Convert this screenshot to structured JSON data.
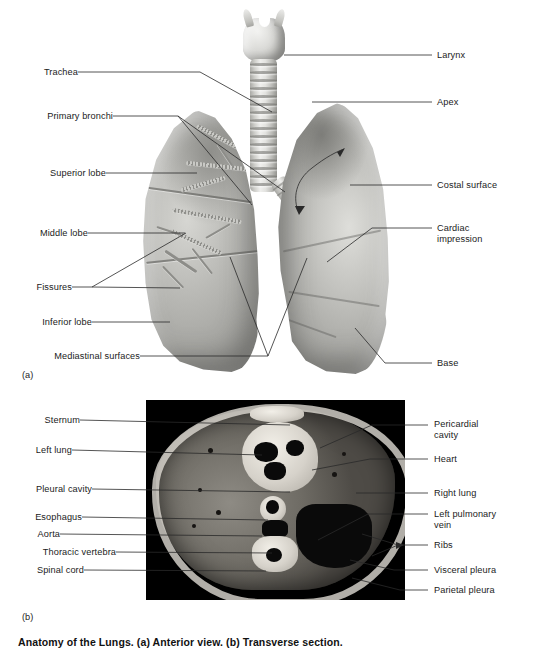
{
  "document": {
    "title": "Anatomy of the Lungs",
    "caption_bottom": "Anatomy of the Lungs. (a) Anterior view. (b) Transverse section."
  },
  "figure_a": {
    "marker": "(a)",
    "labels_left": [
      {
        "name": "trachea",
        "text": "Trachea"
      },
      {
        "name": "primary-bronchi",
        "text": "Primary bronchi"
      },
      {
        "name": "superior-lobe",
        "text": "Superior lobe"
      },
      {
        "name": "middle-lobe",
        "text": "Middle lobe"
      },
      {
        "name": "fissures",
        "text": "Fissures"
      },
      {
        "name": "inferior-lobe",
        "text": "Inferior lobe"
      },
      {
        "name": "mediastinal-surfaces",
        "text": "Mediastinal surfaces"
      }
    ],
    "labels_right": [
      {
        "name": "larynx",
        "text": "Larynx"
      },
      {
        "name": "apex",
        "text": "Apex"
      },
      {
        "name": "costal-surface",
        "text": "Costal surface"
      },
      {
        "name": "cardiac-impression-line1",
        "text": "Cardiac"
      },
      {
        "name": "cardiac-impression-line2",
        "text": "impression"
      },
      {
        "name": "base",
        "text": "Base"
      }
    ]
  },
  "figure_b": {
    "marker": "(b)",
    "labels_left": [
      {
        "name": "sternum",
        "text": "Sternum"
      },
      {
        "name": "left-lung",
        "text": "Left lung"
      },
      {
        "name": "pleural-cavity",
        "text": "Pleural cavity"
      },
      {
        "name": "esophagus",
        "text": "Esophagus"
      },
      {
        "name": "aorta",
        "text": "Aorta"
      },
      {
        "name": "thoracic-vertebra",
        "text": "Thoracic vertebra"
      },
      {
        "name": "spinal-cord",
        "text": "Spinal cord"
      }
    ],
    "labels_right": [
      {
        "name": "pericardial-cavity-line1",
        "text": "Pericardial"
      },
      {
        "name": "pericardial-cavity-line2",
        "text": "cavity"
      },
      {
        "name": "heart",
        "text": "Heart"
      },
      {
        "name": "right-lung",
        "text": "Right lung"
      },
      {
        "name": "left-pulmonary-vein-line1",
        "text": "Left pulmonary"
      },
      {
        "name": "left-pulmonary-vein-line2",
        "text": "vein"
      },
      {
        "name": "ribs",
        "text": "Ribs"
      },
      {
        "name": "visceral-pleura",
        "text": "Visceral pleura"
      },
      {
        "name": "parietal-pleura",
        "text": "Parietal pleura"
      }
    ]
  },
  "colors": {
    "background": "#ffffff",
    "text": "#1b1b1b",
    "leader_line": "#2a2a2a",
    "photo_background": "#000000"
  }
}
